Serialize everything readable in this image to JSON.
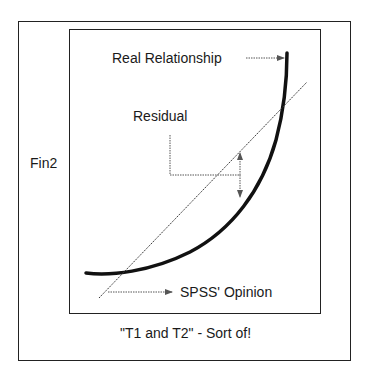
{
  "y_axis_label": "Fin2",
  "caption": "\"T1 and T2\" - Sort of!",
  "annotations": {
    "real_relationship": "Real Relationship",
    "residual": "Residual",
    "spss_opinion": "SPSS' Opinion"
  },
  "colors": {
    "ink": "#1a1a1a",
    "background": "#ffffff"
  }
}
